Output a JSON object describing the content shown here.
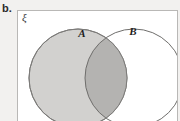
{
  "figure": {
    "part_label": "b.",
    "universal_set_symbol": "ξ",
    "caption": ""
  },
  "venn": {
    "type": "two-set-venn",
    "sets": [
      {
        "id": "A",
        "label": "A",
        "label_x": 64,
        "label_y": 26,
        "cx": 60,
        "cy": 67,
        "r": 49,
        "fill": "#d2d1cf",
        "stroke": "#7c7b79",
        "shaded": true
      },
      {
        "id": "B",
        "label": "B",
        "label_x": 115,
        "label_y": 24,
        "cx": 116,
        "cy": 67,
        "r": 49,
        "fill": "#ffffff",
        "stroke": "#6f6e6c",
        "shaded": false
      }
    ],
    "intersection": {
      "label": "A ∩ B",
      "fill": "#b4b3b1",
      "shaded": true
    },
    "shaded_region_description": "A (including A ∩ B) is shaded",
    "background_fill": "#ffffff",
    "outer_background": "#f2f1ef",
    "border_color": "#b9b8b6"
  }
}
